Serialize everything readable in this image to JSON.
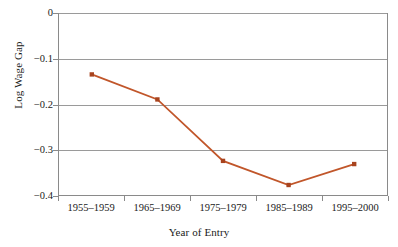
{
  "chart_data": {
    "type": "line",
    "title": "",
    "subtitle": "",
    "xlabel": "Year of Entry",
    "ylabel": "Log Wage Gap",
    "categories": [
      "1955–1959",
      "1965–1969",
      "1975–1979",
      "1985–1989",
      "1995–2000"
    ],
    "values": [
      -0.135,
      -0.19,
      -0.325,
      -0.378,
      -0.332
    ],
    "series": [
      {
        "name": "Log Wage Gap",
        "values": [
          -0.135,
          -0.19,
          -0.325,
          -0.378,
          -0.332
        ]
      }
    ],
    "ylim": [
      -0.4,
      0
    ],
    "y_ticks": [
      0,
      -0.1,
      -0.2,
      -0.3,
      -0.4
    ],
    "y_tick_labels": [
      "0",
      "−0.1",
      "−0.2",
      "−0.3",
      "−0.4"
    ],
    "grid": true,
    "grid_axis": "y",
    "legend": false,
    "legend_position": "none",
    "marker": "square",
    "line_color": "#C1562A",
    "marker_color": "#A8431E",
    "grid_color": "#9A9A9A",
    "axis_color": "#8A8A8A",
    "background_color": "#FFFFFF",
    "text_color": "#1A1A1A",
    "annotations": []
  }
}
